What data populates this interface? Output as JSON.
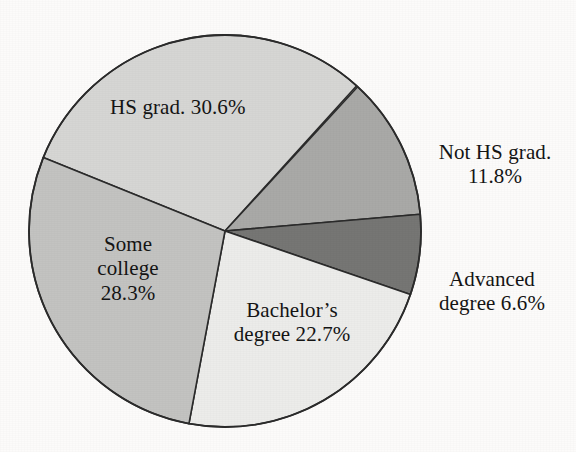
{
  "chart_data": {
    "type": "pie",
    "title": "",
    "subtitle": "",
    "xlabel": "",
    "ylabel": "",
    "legend_position": "none",
    "grid": false,
    "labels_inline": true,
    "unit": "%",
    "total": 100.0,
    "categories": [
      "HS grad.",
      "Not HS grad.",
      "Advanced degree",
      "Bachelor's degree",
      "Some college"
    ],
    "values": [
      30.6,
      11.8,
      6.6,
      22.7,
      28.3
    ],
    "slices": [
      {
        "name": "hs-grad",
        "label": "HS grad. 30.6%",
        "label_lines": [
          "HS grad. 30.6%"
        ],
        "category": "HS grad.",
        "value": 30.6,
        "color": "#d6d6d4",
        "start_angle": 292.0,
        "end_angle": 42.6,
        "sweep": 110.2
      },
      {
        "name": "not-hs-grad",
        "label": "Not HS grad. 11.8%",
        "label_lines": [
          "Not HS grad.",
          "11.8%"
        ],
        "category": "Not HS grad.",
        "value": 11.8,
        "color": "#a9a9a7",
        "start_angle": 42.6,
        "end_angle": 85.1,
        "sweep": 42.5
      },
      {
        "name": "advanced-degree",
        "label": "Advanced degree 6.6%",
        "label_lines": [
          "Advanced",
          "degree 6.6%"
        ],
        "category": "Advanced degree",
        "value": 6.6,
        "color": "#767674",
        "start_angle": 85.1,
        "end_angle": 108.9,
        "sweep": 23.8
      },
      {
        "name": "bachelors-degree",
        "label": "Bachelor's degree 22.7%",
        "label_lines": [
          "Bachelor's",
          "degree 22.7%"
        ],
        "category": "Bachelor's degree",
        "value": 22.7,
        "color": "#ececea",
        "start_angle": 108.9,
        "end_angle": 190.6,
        "sweep": 81.7
      },
      {
        "name": "some-college",
        "label": "Some college 28.3%",
        "label_lines": [
          "Some",
          "college",
          "28.3%"
        ],
        "category": "Some college",
        "value": 28.3,
        "color": "#c3c3c1",
        "start_angle": 190.6,
        "end_angle": 292.0,
        "sweep": 101.4
      }
    ],
    "geometry": {
      "center_x": 225,
      "center_y": 231,
      "radius": 196
    },
    "colors": {
      "background": "#fcfbfa",
      "outline": "#2b2b2b",
      "text": "#141414"
    }
  },
  "labels": {
    "hs_grad": "HS grad. 30.6%",
    "not_hs_grad_line1": "Not HS grad.",
    "not_hs_grad_line2": "11.8%",
    "advanced_line1": "Advanced",
    "advanced_line2": "degree 6.6%",
    "bachelors_line1": "Bachelor’s",
    "bachelors_line2": "degree 22.7%",
    "some_college_line1": "Some",
    "some_college_line2": "college",
    "some_college_line3": "28.3%"
  }
}
